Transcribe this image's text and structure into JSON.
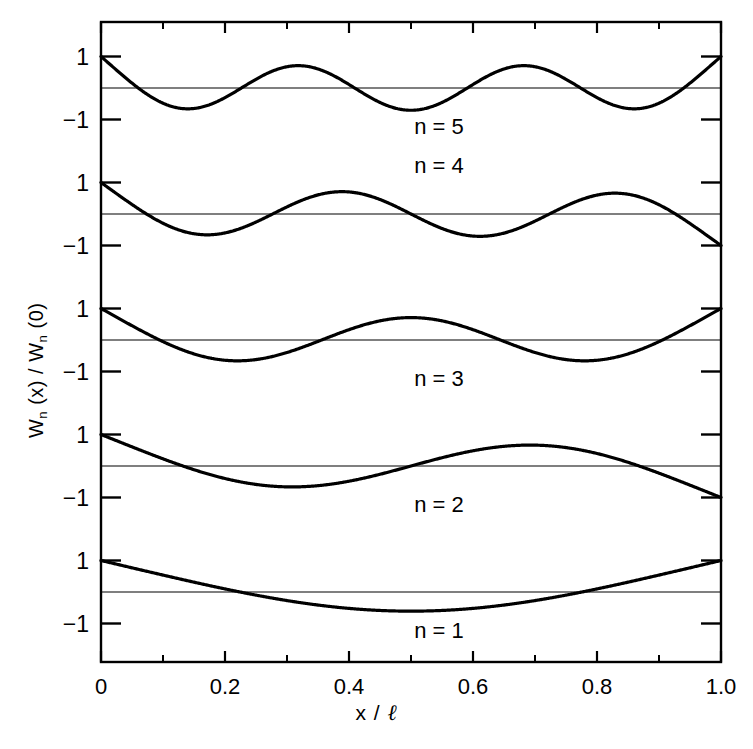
{
  "chart_data": {
    "type": "line",
    "title": "",
    "subtitle": "",
    "xlabel": "x / ℓ",
    "ylabel": "Wₙ (x) / Wₙ (0)",
    "xlim": [
      0,
      1
    ],
    "xticks": [
      0,
      0.2,
      0.4,
      0.6,
      0.8,
      1.0
    ],
    "xticklabels": [
      "0",
      "0.2",
      "0.4",
      "0.6",
      "0.8",
      "1.0"
    ],
    "xminorticks": [
      0.1,
      0.3,
      0.5,
      0.7,
      0.9
    ],
    "panel_ylim": [
      -1.6,
      1.35
    ],
    "panel_yticks": [
      1,
      0,
      -1
    ],
    "panel_yticklabels": [
      "1",
      "",
      "−1"
    ],
    "grid": false,
    "legend_position": "inline-right-of-center",
    "series": [
      {
        "name": "n = 1",
        "label": "n = 1",
        "n": 1,
        "beta_l": 4.73004074,
        "panel_index": 0,
        "endpoints": {
          "x0_value": 1.0,
          "x1_value": 1.0
        },
        "extrema": [
          {
            "x": 0.5,
            "y": -0.88
          }
        ],
        "zero_crossings": [
          0.2242,
          0.7758
        ],
        "symmetry": "symmetric"
      },
      {
        "name": "n = 2",
        "label": "n = 2",
        "n": 2,
        "beta_l": 7.85320462,
        "panel_index": 1,
        "endpoints": {
          "x0_value": 1.0,
          "x1_value": -0.9
        },
        "extrema": [
          {
            "x": 0.3083,
            "y": -0.68
          },
          {
            "x": 0.6917,
            "y": 0.62
          }
        ],
        "zero_crossings": [
          0.1321,
          0.5,
          0.8679
        ],
        "symmetry": "antisymmetric"
      },
      {
        "name": "n = 3",
        "label": "n = 3",
        "n": 3,
        "beta_l": 10.9956079,
        "panel_index": 2,
        "endpoints": {
          "x0_value": 1.0,
          "x1_value": 1.0
        },
        "extrema": [
          {
            "x": 0.2222,
            "y": -0.64
          },
          {
            "x": 0.5,
            "y": 0.62
          },
          {
            "x": 0.7778,
            "y": -0.64
          }
        ],
        "zero_crossings": [
          0.0944,
          0.3558,
          0.6442,
          0.9056
        ],
        "symmetry": "symmetric"
      },
      {
        "name": "n = 4",
        "label": "n = 4",
        "n": 4,
        "beta_l": 14.1371655,
        "panel_index": 3,
        "endpoints": {
          "x0_value": 1.0,
          "x1_value": -0.9
        },
        "extrema": [
          {
            "x": 0.1735,
            "y": -0.64
          },
          {
            "x": 0.3887,
            "y": 0.6
          },
          {
            "x": 0.6113,
            "y": -0.6
          },
          {
            "x": 0.8265,
            "y": 0.5
          }
        ],
        "zero_crossings": [
          0.0735,
          0.2768,
          0.5,
          0.7232,
          0.9265
        ],
        "symmetry": "antisymmetric"
      },
      {
        "name": "n = 5",
        "label": "n = 5",
        "n": 5,
        "beta_l": 17.2787596,
        "panel_index": 4,
        "endpoints": {
          "x0_value": 1.0,
          "x1_value": 1.0
        },
        "extrema": [
          {
            "x": 0.1425,
            "y": -0.65
          },
          {
            "x": 0.3185,
            "y": 0.68
          },
          {
            "x": 0.5,
            "y": -0.7
          },
          {
            "x": 0.6815,
            "y": 0.68
          },
          {
            "x": 0.8575,
            "y": -0.65
          }
        ],
        "zero_crossings": [
          0.06,
          0.2265,
          0.4,
          0.6,
          0.7735,
          0.94
        ],
        "symmetry": "symmetric"
      }
    ]
  },
  "axes": {
    "xlabel": "x / ℓ",
    "ylabel_parts": {
      "w1": "W",
      "n1": "n",
      "mid": " (x) / ",
      "w2": "W",
      "n2": "n",
      "tail": " (0)"
    },
    "xticklabels": [
      "0",
      "0.2",
      "0.4",
      "0.6",
      "0.8",
      "1.0"
    ],
    "yticklabel_pos": "1",
    "yticklabel_neg": "−1"
  },
  "style": {
    "frame_color": "#000000",
    "curve_color": "#000000",
    "zero_line_color": "#000000",
    "background": "#ffffff",
    "curve_width_px": 3.2,
    "zero_line_width_px": 1.1,
    "frame_width_px": 2.4
  },
  "geometry": {
    "plot_left": 101,
    "plot_right": 721,
    "plot_top": 22,
    "plot_bottom": 662,
    "panel_zero_y": [
      592,
      466,
      340,
      214,
      88
    ],
    "panel_unit_px": 31.5
  }
}
